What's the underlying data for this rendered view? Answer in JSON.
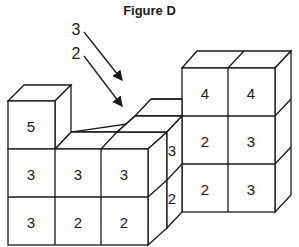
{
  "figure": {
    "title": "Figure D",
    "arrow_labels": [
      "3",
      "2"
    ],
    "left_block": {
      "top_row": [
        "5"
      ],
      "middle_row": [
        "3",
        "3",
        "3"
      ],
      "bottom_row": [
        "3",
        "2",
        "2"
      ]
    },
    "middle_side": {
      "upper": "3",
      "lower": "2"
    },
    "right_tower": {
      "top_row": [
        "4",
        "4"
      ],
      "middle_row": [
        "2",
        "3"
      ],
      "bottom_row": [
        "2",
        "3"
      ]
    },
    "colors": {
      "stroke": "#1a1a1a",
      "fill": "#ffffff"
    }
  }
}
